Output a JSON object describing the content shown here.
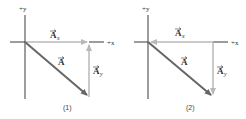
{
  "colors": {
    "axis": "#3a3a3a",
    "vector_A": "#666666",
    "component": "#b8b8b8",
    "text": "#333333"
  },
  "panels": [
    {
      "caption": "(1)",
      "axis_y_label": "+y",
      "axis_x_label": "+x",
      "vector_label": "A",
      "component_x_label": "A",
      "component_x_sub": "x",
      "component_y_label": "A",
      "component_y_sub": "y",
      "description": "Ax points right along +x from origin; Ay points up from tip of A to end of Ax; A points down-right from origin"
    },
    {
      "caption": "(2)",
      "axis_y_label": "+y",
      "axis_x_label": "+x",
      "vector_label": "A",
      "component_x_label": "A",
      "component_x_sub": "x",
      "component_y_label": "A",
      "component_y_sub": "y",
      "description": "Ax points left toward origin; Ay points down; A points down-right from origin"
    }
  ]
}
